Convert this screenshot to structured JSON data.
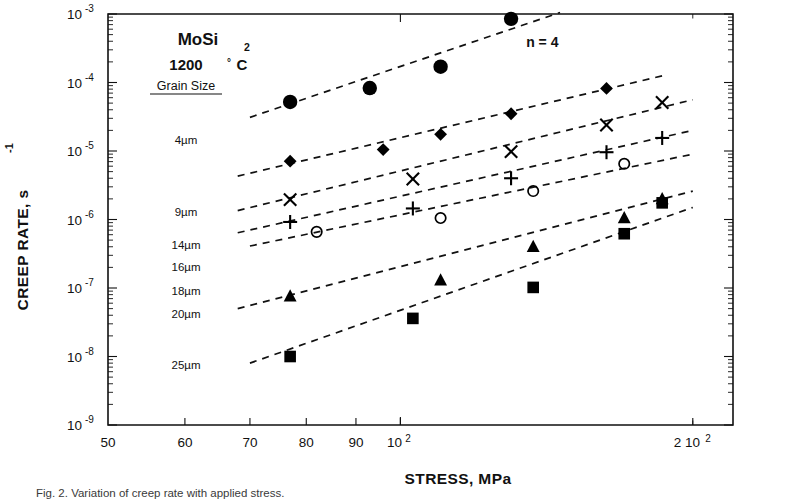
{
  "figure": {
    "caption": "Fig. 2. Variation of creep rate with applied stress."
  },
  "chart_data": {
    "type": "scatter",
    "xlabel": "STRESS,  MPa",
    "ylabel": "CREEP RATE, s",
    "ylabel_exponent": "-1",
    "xscale": "log",
    "yscale": "log",
    "xlim": [
      50,
      220
    ],
    "ylim": [
      1e-09,
      0.001
    ],
    "grid": false,
    "legend_position": "upper-left-inside",
    "xticks": [
      {
        "value": 50,
        "label": "50",
        "exp": ""
      },
      {
        "value": 60,
        "label": "60",
        "exp": ""
      },
      {
        "value": 70,
        "label": "70",
        "exp": ""
      },
      {
        "value": 80,
        "label": "80",
        "exp": ""
      },
      {
        "value": 90,
        "label": "90",
        "exp": ""
      },
      {
        "value": 100,
        "label": "10",
        "exp": "2"
      },
      {
        "value": 200,
        "label": "2 10",
        "exp": "2"
      }
    ],
    "yticks": [
      {
        "value": 0.001,
        "label": "10",
        "exp": "-3"
      },
      {
        "value": 0.0001,
        "label": "10",
        "exp": "-4"
      },
      {
        "value": 1e-05,
        "label": "10",
        "exp": "-5"
      },
      {
        "value": 1e-06,
        "label": "10",
        "exp": "-6"
      },
      {
        "value": 1e-07,
        "label": "10",
        "exp": "-7"
      },
      {
        "value": 1e-08,
        "label": "10",
        "exp": "-8"
      },
      {
        "value": 1e-09,
        "label": "10",
        "exp": "-9"
      }
    ],
    "annotations": [
      {
        "name": "stress-exponent",
        "text": "n = 4",
        "x": 140,
        "y": 0.00033
      }
    ],
    "legend_header": "Grain Size",
    "series": [
      {
        "name": "4µm",
        "label": "4µm",
        "marker": "filled-circle",
        "color": "#000000",
        "points": [
          {
            "x": 77,
            "y": 5.2e-05
          },
          {
            "x": 93,
            "y": 8.3e-05
          },
          {
            "x": 110,
            "y": 0.00017
          },
          {
            "x": 130,
            "y": 0.00085
          }
        ],
        "fit": {
          "x0": 70,
          "y0": 3.1e-05,
          "x1": 146,
          "y1": 0.00105
        }
      },
      {
        "name": "9µm",
        "label": "9µm",
        "marker": "filled-diamond",
        "color": "#000000",
        "points": [
          {
            "x": 77,
            "y": 7.1e-06
          },
          {
            "x": 96,
            "y": 1.05e-05
          },
          {
            "x": 110,
            "y": 1.75e-05
          },
          {
            "x": 130,
            "y": 3.5e-05
          },
          {
            "x": 163,
            "y": 8.2e-05
          }
        ],
        "fit": {
          "x0": 68,
          "y0": 4.3e-06,
          "x1": 186,
          "y1": 0.000125
        }
      },
      {
        "name": "14µm",
        "label": "14µm",
        "marker": "cross-x",
        "color": "#000000",
        "points": [
          {
            "x": 77,
            "y": 1.95e-06
          },
          {
            "x": 103,
            "y": 3.9e-06
          },
          {
            "x": 130,
            "y": 9.8e-06
          },
          {
            "x": 163,
            "y": 2.4e-05
          },
          {
            "x": 186,
            "y": 5.1e-05
          }
        ],
        "fit": {
          "x0": 68,
          "y0": 1.35e-06,
          "x1": 200,
          "y1": 5.6e-05
        }
      },
      {
        "name": "16µm",
        "label": "16µm",
        "marker": "plus",
        "color": "#000000",
        "points": [
          {
            "x": 77,
            "y": 9.2e-07
          },
          {
            "x": 103,
            "y": 1.45e-06
          },
          {
            "x": 130,
            "y": 4e-06
          },
          {
            "x": 163,
            "y": 9.6e-06
          },
          {
            "x": 186,
            "y": 1.55e-05
          }
        ],
        "fit": {
          "x0": 68,
          "y0": 6.4e-07,
          "x1": 200,
          "y1": 2e-05
        }
      },
      {
        "name": "18µm",
        "label": "18µm",
        "marker": "open-circle",
        "color": "#000000",
        "points": [
          {
            "x": 82,
            "y": 6.6e-07
          },
          {
            "x": 110,
            "y": 1.05e-06
          },
          {
            "x": 137,
            "y": 2.6e-06
          },
          {
            "x": 170,
            "y": 6.5e-06
          }
        ],
        "fit": {
          "x0": 70,
          "y0": 4.1e-07,
          "x1": 200,
          "y1": 9e-06
        }
      },
      {
        "name": "20µm",
        "label": "20µm",
        "marker": "filled-triangle",
        "color": "#000000",
        "points": [
          {
            "x": 77,
            "y": 7.6e-08
          },
          {
            "x": 110,
            "y": 1.3e-07
          },
          {
            "x": 137,
            "y": 4e-07
          },
          {
            "x": 170,
            "y": 1.05e-06
          },
          {
            "x": 186,
            "y": 2e-06
          }
        ],
        "fit": {
          "x0": 68,
          "y0": 5e-08,
          "x1": 200,
          "y1": 2.6e-06
        }
      },
      {
        "name": "25µm",
        "label": "25µm",
        "marker": "filled-square",
        "color": "#000000",
        "points": [
          {
            "x": 77,
            "y": 1e-08
          },
          {
            "x": 103,
            "y": 3.6e-08
          },
          {
            "x": 137,
            "y": 1.02e-07
          },
          {
            "x": 170,
            "y": 6.2e-07
          },
          {
            "x": 186,
            "y": 1.75e-06
          }
        ],
        "fit": {
          "x0": 70,
          "y0": 8e-09,
          "x1": 200,
          "y1": 1.5e-06
        }
      }
    ],
    "legend_labels_positions": [
      {
        "label": "4µm",
        "y": 1.45e-05
      },
      {
        "label": "9µm",
        "y": 1.3e-06
      },
      {
        "label": "14µm",
        "y": 4.2e-07
      },
      {
        "label": "16µm",
        "y": 2e-07
      },
      {
        "label": "18µm",
        "y": 9e-08
      },
      {
        "label": "20µm",
        "y": 4.2e-08
      },
      {
        "label": "25µm",
        "y": 7.5e-09
      }
    ],
    "legend_box": {
      "compound": "MoSi",
      "compound_sub": "2",
      "temperature": "1200",
      "degree": "°",
      "unit": "C"
    }
  }
}
